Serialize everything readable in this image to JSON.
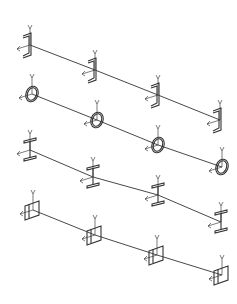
{
  "diagram": {
    "colors": {
      "line": "#333333",
      "background": "#ffffff"
    },
    "axis_labels": {
      "vertical": "Y"
    },
    "rows": [
      {
        "section": "channel",
        "nodes": [
          [
            30,
            45
          ],
          [
            95,
            70
          ],
          [
            158,
            95
          ],
          [
            220,
            120
          ]
        ]
      },
      {
        "section": "circular",
        "nodes": [
          [
            32,
            94
          ],
          [
            97,
            120
          ],
          [
            158,
            145
          ],
          [
            222,
            167
          ]
        ]
      },
      {
        "section": "i-beam",
        "nodes": [
          [
            30,
            150
          ],
          [
            93,
            177
          ],
          [
            158,
            195
          ],
          [
            221,
            222
          ]
        ]
      },
      {
        "section": "box",
        "nodes": [
          [
            33,
            210
          ],
          [
            95,
            235
          ],
          [
            157,
            255
          ],
          [
            222,
            275
          ]
        ]
      }
    ]
  }
}
